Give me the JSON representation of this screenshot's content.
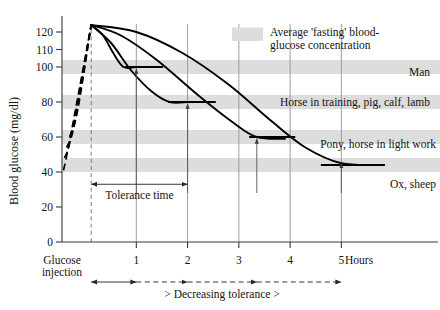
{
  "chart_data": {
    "type": "line",
    "title": "",
    "xlabel": "Hours",
    "ylabel": "Blood glucose (mg/dl)",
    "xlim": [
      -0.45,
      6.3
    ],
    "ylim": [
      0,
      128
    ],
    "grid": "vertical gridlines at hours 1-5; dashed vertical line at glucose injection",
    "legend_position": "top-right inside plot",
    "x_ticks": [
      "1",
      "2",
      "3",
      "4",
      "5"
    ],
    "x_tick_values": [
      1,
      2,
      3,
      4,
      5
    ],
    "x_origin_label_line1": "Glucose",
    "x_origin_label_line2": "injection",
    "y_ticks": [
      "0",
      "20",
      "40",
      "60",
      "80",
      "100",
      "110",
      "120"
    ],
    "y_tick_values": [
      0,
      20,
      40,
      60,
      80,
      100,
      110,
      120
    ],
    "peak_value": 124,
    "peak_hour": 0.12,
    "fasting_bands": [
      {
        "label": "Man",
        "low": 96,
        "high": 104
      },
      {
        "label": "Horse in training, pig, calf, lamb",
        "low": 76,
        "high": 84
      },
      {
        "label": "Pony, horse in light work",
        "low": 56,
        "high": 64
      },
      {
        "label": "Ox, sheep",
        "low": 40,
        "high": 48
      }
    ],
    "series": [
      {
        "name": "Man",
        "tolerance_time_hours": 1.0,
        "fasting_level": 100,
        "points": [
          [
            -0.42,
            41
          ],
          [
            -0.3,
            58
          ],
          [
            0.12,
            124
          ],
          [
            0.35,
            118
          ],
          [
            0.55,
            108
          ],
          [
            0.75,
            100
          ],
          [
            1.0,
            100
          ]
        ],
        "plateau": {
          "from_hour": 0.78,
          "to_hour": 1.52,
          "value": 100
        }
      },
      {
        "name": "Horse in training, pig, calf, lamb",
        "tolerance_time_hours": 2.0,
        "fasting_level": 80,
        "points": [
          [
            -0.4,
            48
          ],
          [
            -0.26,
            62
          ],
          [
            0.12,
            124
          ],
          [
            0.5,
            114
          ],
          [
            0.9,
            98
          ],
          [
            1.3,
            86
          ],
          [
            1.65,
            80
          ],
          [
            2.0,
            80
          ]
        ],
        "plateau": {
          "from_hour": 1.62,
          "to_hour": 2.55,
          "value": 80
        }
      },
      {
        "name": "Pony, horse in light work",
        "tolerance_time_hours": 3.35,
        "fasting_level": 60,
        "points": [
          [
            -0.36,
            54
          ],
          [
            -0.2,
            68
          ],
          [
            0.12,
            124
          ],
          [
            0.7,
            118
          ],
          [
            1.4,
            104
          ],
          [
            2.2,
            84
          ],
          [
            2.9,
            68
          ],
          [
            3.35,
            60
          ],
          [
            3.9,
            59
          ]
        ],
        "plateau": {
          "from_hour": 3.2,
          "to_hour": 4.1,
          "value": 60
        }
      },
      {
        "name": "Ox, sheep",
        "tolerance_time_hours": 5.0,
        "fasting_level": 44,
        "points": [
          [
            -0.3,
            60
          ],
          [
            -0.14,
            76
          ],
          [
            0.12,
            124
          ],
          [
            1.0,
            120
          ],
          [
            1.9,
            108
          ],
          [
            2.8,
            90
          ],
          [
            3.6,
            70
          ],
          [
            4.3,
            54
          ],
          [
            5.0,
            45
          ],
          [
            5.75,
            44
          ]
        ],
        "plateau": {
          "from_hour": 4.6,
          "to_hour": 5.85,
          "value": 44
        }
      }
    ],
    "tolerance_arrows": [
      {
        "hour": 1.0,
        "from_value": 28,
        "to_value": 99
      },
      {
        "hour": 2.0,
        "from_value": 28,
        "to_value": 79
      },
      {
        "hour": 3.35,
        "from_value": 28,
        "to_value": 59
      },
      {
        "hour": 5.0,
        "from_value": 28,
        "to_value": 45
      }
    ]
  },
  "legend": {
    "swatch_color": "#dddddd",
    "text_line1": "Average 'fasting' blood-",
    "text_line2": "glucose concentration"
  },
  "annotations": {
    "tolerance_time": {
      "text": "Tolerance time",
      "from_hour": 0.12,
      "to_hour": 2.0,
      "value": 33
    },
    "decreasing_tolerance": {
      "text": "> Decreasing tolerance >",
      "segments": [
        {
          "from_hour": 0.12,
          "to_hour": 1.0,
          "dashed": false
        },
        {
          "from_hour": 1.0,
          "to_hour": 2.0,
          "dashed": true
        },
        {
          "from_hour": 2.0,
          "to_hour": 3.35,
          "dashed": true
        },
        {
          "from_hour": 3.35,
          "to_hour": 5.0,
          "dashed": true
        }
      ]
    }
  },
  "series_labels": [
    {
      "name": "Man",
      "x": 430,
      "y": 76,
      "anchor": "end"
    },
    {
      "name": "Horse in training, pig, calf, lamb",
      "x": 430,
      "y": 106,
      "anchor": "end"
    },
    {
      "name": "Pony, horse in light work",
      "x": 436,
      "y": 148,
      "anchor": "end"
    },
    {
      "name": "Ox, sheep",
      "x": 436,
      "y": 188,
      "anchor": "end"
    }
  ],
  "colors": {
    "curve": "#000000",
    "band": "#dddddd",
    "axis": "#3a3a3a",
    "background": "#ffffff"
  }
}
